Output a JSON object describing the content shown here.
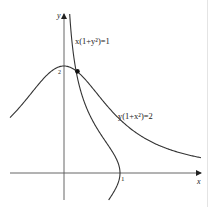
{
  "figure": {
    "type": "curve-sketch",
    "axes": {
      "x_label": "x",
      "y_label": "y",
      "x_tick_label": "1",
      "y_tick_label": "2",
      "origin_px": [
        64,
        173
      ],
      "unit_px_x": 56,
      "unit_px_y": 53.5
    },
    "curves": [
      {
        "name": "curve-a",
        "equation_label": "x(1+y²)=1",
        "equation": "x(1+y^2)=1",
        "color": "#333333"
      },
      {
        "name": "curve-b",
        "equation_label": "y(1+x²)=2",
        "equation": "y(1+x^2)=2",
        "color": "#333333"
      }
    ],
    "intersection": {
      "label": "",
      "point": [
        0.24,
        1.9
      ],
      "color": "#111111"
    }
  }
}
